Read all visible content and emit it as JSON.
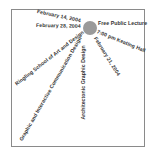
{
  "poster": {
    "center_marker": {
      "shape": "circle",
      "color": "#9a9a9a"
    },
    "rays": [
      {
        "id": "date-feb-14",
        "text": "February 14, 2004"
      },
      {
        "id": "date-feb-28",
        "text": "February 28, 2004"
      },
      {
        "id": "free-lecture",
        "text": "Free Public Lecture"
      },
      {
        "id": "time-location",
        "text": "7:00 pm Keating Hall"
      },
      {
        "id": "date-feb-21",
        "text": "February 21, 2004"
      },
      {
        "id": "architectonic",
        "text": "Architectonic Graphic Design"
      },
      {
        "id": "ringling",
        "text": "Ringling School of Art and Design"
      },
      {
        "id": "graphic-interactive",
        "text": "Graphic and Interactive Communication Design"
      }
    ]
  },
  "colors": {
    "frame_border": "#8a8a8a",
    "text": "#333333",
    "background": "#ffffff"
  }
}
